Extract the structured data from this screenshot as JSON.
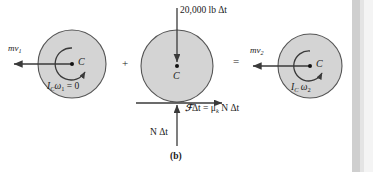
{
  "figure": {
    "caption": "(b)",
    "type": "impulse-momentum-diagram",
    "background_color": "#ffffff",
    "disk_fill": "#d4d4d4",
    "disk_stroke": "#555555",
    "arrow_color": "#3a3a3a",
    "text_color": "#1a1a1a"
  },
  "operators": {
    "plus": "+",
    "equals": "="
  },
  "panels": [
    {
      "id": "initial-momenta",
      "center_label": "C",
      "linear_momentum": {
        "label_main": "mv",
        "label_sub": "1",
        "direction": "left"
      },
      "angular_momentum": {
        "label_main": "I",
        "label_sub_c": "C",
        "label_omega": "ω",
        "label_omega_sub": "1",
        "label_tail": "= 0",
        "full_text": "I_C ω₁ = 0",
        "spin_direction": "counterclockwise"
      }
    },
    {
      "id": "impulses",
      "center_label": "C",
      "weight_impulse": {
        "text": "20,000 lb Δt",
        "direction": "down"
      },
      "friction_impulse": {
        "symbol": "ℱ",
        "text": "Δt = μ",
        "sub": "k",
        "text_tail": "N Δt",
        "full_text": "ℱ Δt = μₖ N Δt",
        "direction": "right"
      },
      "normal_impulse": {
        "text": "N Δt",
        "direction": "up"
      }
    },
    {
      "id": "final-momenta",
      "center_label": "C",
      "linear_momentum": {
        "label_main": "mv",
        "label_sub": "2",
        "direction": "left"
      },
      "angular_momentum": {
        "label_main": "I",
        "label_sub_c": "C",
        "label_omega": "ω",
        "label_omega_sub": "2",
        "full_text": "I_C ω₂",
        "spin_direction": "clockwise"
      }
    }
  ]
}
